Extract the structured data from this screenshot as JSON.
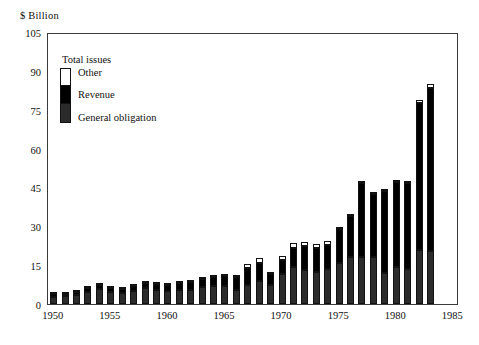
{
  "chart_data": {
    "type": "bar",
    "stacked": true,
    "title": "",
    "ylabel": "$ Billion",
    "xlabel": "",
    "ylim": [
      0,
      105
    ],
    "yticks": [
      0,
      15,
      30,
      45,
      60,
      75,
      90,
      105
    ],
    "xlim": [
      1949.5,
      1985.5
    ],
    "xticks": [
      1950,
      1955,
      1960,
      1965,
      1970,
      1975,
      1980,
      1985
    ],
    "grid": false,
    "legend_title": "Total issues",
    "legend_position": "upper-left-inside",
    "categories": [
      1950,
      1951,
      1952,
      1953,
      1954,
      1955,
      1956,
      1957,
      1958,
      1959,
      1960,
      1961,
      1962,
      1963,
      1964,
      1965,
      1966,
      1967,
      1968,
      1969,
      1970,
      1971,
      1972,
      1973,
      1974,
      1975,
      1976,
      1977,
      1978,
      1979,
      1980,
      1981,
      1982,
      1983
    ],
    "series": [
      {
        "name": "General obligation",
        "color": "#2b2b2b",
        "values": [
          2.8,
          3.0,
          3.6,
          4.8,
          5.7,
          4.5,
          4.3,
          5.1,
          6.0,
          5.3,
          5.0,
          5.5,
          5.6,
          6.4,
          7.0,
          6.9,
          5.5,
          7.5,
          8.7,
          7.2,
          11.6,
          14.3,
          13.3,
          12.2,
          13.6,
          16.0,
          18.0,
          18.1,
          18.2,
          12.1,
          14.1,
          13.6,
          21.0,
          20.5
        ]
      },
      {
        "name": "Revenue",
        "color": "#000000",
        "values": [
          0.9,
          0.8,
          1.2,
          1.4,
          1.5,
          1.6,
          1.6,
          1.8,
          2.3,
          2.3,
          2.2,
          2.5,
          3.0,
          3.3,
          3.5,
          4.0,
          5.0,
          6.3,
          7.2,
          4.4,
          5.3,
          7.2,
          9.0,
          9.5,
          9.3,
          13.0,
          16.0,
          28.6,
          24.1,
          31.5,
          33.0,
          33.1,
          56.5,
          63.0
        ]
      },
      {
        "name": "Other",
        "color": "#ffffff",
        "values": [
          0.1,
          0.1,
          0.1,
          0.1,
          0.1,
          0.2,
          0.2,
          0.2,
          0.2,
          0.2,
          0.2,
          0.3,
          0.4,
          0.4,
          0.4,
          0.4,
          0.5,
          1.5,
          1.7,
          0.5,
          1.6,
          2.0,
          1.8,
          1.5,
          1.3,
          0.5,
          0.5,
          0.7,
          0.6,
          0.7,
          0.6,
          0.6,
          1.3,
          1.5
        ]
      }
    ],
    "totals": [
      3.8,
      3.9,
      4.9,
      6.3,
      7.3,
      6.3,
      6.1,
      7.1,
      8.5,
      7.8,
      7.4,
      8.3,
      9.0,
      10.1,
      10.9,
      11.3,
      11.0,
      15.3,
      17.6,
      12.1,
      18.5,
      23.5,
      24.1,
      23.2,
      24.2,
      29.5,
      34.5,
      47.4,
      42.9,
      44.3,
      47.7,
      47.3,
      78.8,
      85.0
    ]
  },
  "axis": {
    "y_title": "$ Billion",
    "y_labels": [
      "105",
      "90",
      "75",
      "60",
      "45",
      "30",
      "15",
      "0"
    ],
    "x_labels": [
      "1950",
      "1955",
      "1960",
      "1965",
      "1970",
      "1975",
      "1980",
      "1985"
    ]
  },
  "legend": {
    "title": "Total issues",
    "items": [
      "Other",
      "Revenue",
      "General obligation"
    ]
  }
}
